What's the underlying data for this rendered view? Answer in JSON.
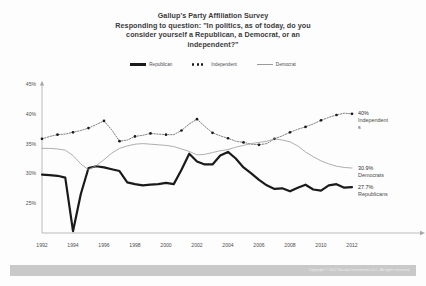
{
  "title": {
    "line1": "Gallup's Party Affiliation Survey",
    "line2": "Responding to question: \"In politics, as of today, do you",
    "line3": "consider yourself a Republican, a Democrat, or an",
    "line4": "independent?\""
  },
  "legend": {
    "items": [
      {
        "label": "Republican",
        "marker": "solid-thick-line",
        "color": "#1a1a1a"
      },
      {
        "label": "Independent",
        "marker": "dotted-line",
        "color": "#1a1a1a"
      },
      {
        "label": "Democrat",
        "marker": "thin-line",
        "color": "#9a9a9a"
      }
    ]
  },
  "annotations": [
    {
      "value": "40%",
      "name": "Independent",
      "name2": "s"
    },
    {
      "value": "30.9%",
      "name": "Democrats",
      "name2": ""
    },
    {
      "value": "27.7%",
      "name": "Republicans",
      "name2": ""
    }
  ],
  "footer": {
    "copyright": "Copyright © 2012 Secular Investments LLC. All rights reserved."
  },
  "chart_data": {
    "type": "line",
    "title": "Gallup's Party Affiliation Survey",
    "subtitle": "Responding to question: \"In politics, as of today, do you consider yourself a Republican, a Democrat, or an independent?\"",
    "xlabel": "",
    "ylabel": "",
    "ylim": [
      20,
      45
    ],
    "xlim": [
      1992,
      2012
    ],
    "yticks": [
      "45%",
      "40%",
      "35%",
      "30%",
      "25%"
    ],
    "ytick_values": [
      45,
      40,
      35,
      30,
      25
    ],
    "xticks": [
      "1992",
      "1994",
      "1996",
      "1998",
      "2000",
      "2002",
      "2004",
      "2006",
      "2008",
      "2010",
      "2012"
    ],
    "xtick_values": [
      1992,
      1994,
      1996,
      1998,
      2000,
      2002,
      2004,
      2006,
      2008,
      2010,
      2012
    ],
    "grid": false,
    "legend_position": "top-center",
    "x": [
      1992,
      1992.5,
      1993,
      1993.5,
      1994,
      1994.5,
      1995,
      1995.5,
      1996,
      1996.5,
      1997,
      1997.5,
      1998,
      1998.5,
      1999,
      1999.5,
      2000,
      2000.5,
      2001,
      2001.5,
      2002,
      2002.5,
      2003,
      2003.5,
      2004,
      2004.5,
      2005,
      2005.5,
      2006,
      2006.5,
      2007,
      2007.5,
      2008,
      2008.5,
      2009,
      2009.5,
      2010,
      2010.5,
      2011,
      2011.5,
      2012
    ],
    "series": [
      {
        "name": "Republican",
        "color": "#1a1a1a",
        "style": "solid-thick",
        "values": [
          29.8,
          29.7,
          29.6,
          29.3,
          20.3,
          26.5,
          30.9,
          31.2,
          31.0,
          30.7,
          30.4,
          28.5,
          28.2,
          28.0,
          28.1,
          28.2,
          28.4,
          28.2,
          30.6,
          33.3,
          32.0,
          31.5,
          31.5,
          33.0,
          33.6,
          32.5,
          31.0,
          30.0,
          28.9,
          28.0,
          27.4,
          27.5,
          27.0,
          27.6,
          28.1,
          27.3,
          27.1,
          28.0,
          28.2,
          27.6,
          27.7
        ]
      },
      {
        "name": "Independent",
        "color": "#1a1a1a",
        "style": "dotted-marker",
        "values": [
          35.8,
          36.2,
          36.5,
          36.6,
          36.9,
          37.2,
          37.6,
          38.2,
          38.8,
          37.3,
          35.4,
          35.6,
          36.2,
          36.4,
          36.7,
          36.6,
          36.5,
          36.5,
          37.2,
          38.3,
          39.1,
          37.9,
          36.8,
          36.3,
          35.9,
          35.4,
          35.2,
          34.9,
          34.8,
          35.0,
          35.8,
          36.3,
          36.9,
          37.4,
          37.8,
          38.3,
          38.9,
          39.4,
          39.8,
          40.1,
          40.0
        ]
      },
      {
        "name": "Democrat",
        "color": "#9a9a9a",
        "style": "thin",
        "values": [
          34.2,
          34.2,
          34.1,
          33.9,
          33.0,
          31.6,
          30.6,
          31.3,
          32.3,
          33.4,
          34.2,
          34.6,
          34.9,
          35.0,
          34.9,
          34.8,
          34.7,
          34.5,
          34.1,
          33.7,
          33.1,
          33.2,
          33.5,
          33.8,
          34.0,
          34.4,
          34.7,
          35.0,
          35.2,
          35.4,
          35.8,
          35.6,
          35.3,
          34.6,
          33.6,
          32.8,
          32.1,
          31.6,
          31.2,
          31.0,
          30.9
        ]
      }
    ]
  }
}
